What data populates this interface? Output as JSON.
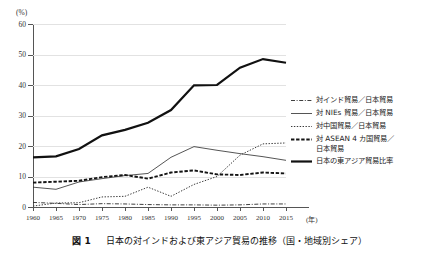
{
  "figure": {
    "caption_number": "図 1",
    "caption_title": "日本の対インドおよび東アジア貿易の推移（国・地域別シェア）",
    "unit_label": "(%)",
    "xaxis_unit": "(年)"
  },
  "legend": {
    "items": [
      {
        "label": "対インド貿易／日本貿易",
        "style": "dash-dot",
        "name": "legend-india"
      },
      {
        "label": "対 NIEs 貿易／日本貿易",
        "style": "solid-thin",
        "name": "legend-nies"
      },
      {
        "label": "対中国貿易／日本貿易",
        "style": "dotted",
        "name": "legend-china"
      },
      {
        "label": "対 ASEAN 4 カ国貿易／\n日本貿易",
        "style": "dashed-bold",
        "name": "legend-asean4"
      },
      {
        "label": "日本の東アジア貿易比率",
        "style": "solid-thick",
        "name": "legend-east-asia"
      }
    ]
  },
  "chart_data": {
    "type": "line",
    "title": "日本の対インドおよび東アジア貿易の推移（国・地域別シェア）",
    "xlabel": "(年)",
    "ylabel": "(%)",
    "xlim": [
      1960,
      2015
    ],
    "ylim": [
      0,
      60
    ],
    "ytick_values": [
      0,
      10,
      20,
      30,
      40,
      50,
      60
    ],
    "xtick_values": [
      1960,
      1965,
      1970,
      1975,
      1980,
      1985,
      1990,
      1995,
      2000,
      2005,
      2010,
      2015
    ],
    "grid": "horizontal",
    "legend_position": "right",
    "x": [
      1960,
      1965,
      1970,
      1975,
      1980,
      1985,
      1990,
      1995,
      2000,
      2005,
      2010,
      2015
    ],
    "series": [
      {
        "name": "対インド貿易／日本貿易",
        "style": "dash-dot",
        "values": [
          1.5,
          1.2,
          0.8,
          1.1,
          1.0,
          0.8,
          0.7,
          0.7,
          0.6,
          0.7,
          1.0,
          1.0
        ]
      },
      {
        "name": "対 NIEs 貿易／日本貿易",
        "style": "solid-thin",
        "values": [
          6.5,
          5.8,
          8.2,
          9.3,
          10.3,
          11.0,
          16.3,
          19.8,
          18.6,
          17.5,
          16.5,
          15.3
        ]
      },
      {
        "name": "対中国貿易／日本貿易",
        "style": "dotted",
        "values": [
          0.3,
          1.3,
          1.4,
          3.3,
          3.5,
          6.5,
          3.5,
          7.4,
          10.0,
          17.0,
          20.7,
          21.0
        ]
      },
      {
        "name": "対 ASEAN 4 カ国貿易／日本貿易",
        "style": "dashed-bold",
        "values": [
          8.0,
          8.3,
          8.6,
          9.8,
          10.5,
          9.3,
          11.3,
          12.0,
          10.7,
          10.5,
          11.3,
          11.0
        ]
      },
      {
        "name": "日本の東アジア貿易比率",
        "style": "solid-thick",
        "values": [
          16.3,
          16.6,
          19.0,
          23.5,
          25.3,
          27.6,
          31.8,
          39.9,
          40.0,
          45.7,
          48.5,
          47.3
        ]
      }
    ]
  }
}
